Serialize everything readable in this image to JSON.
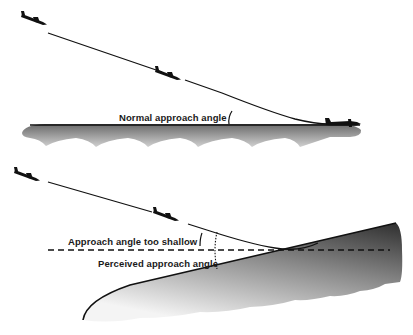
{
  "diagram": {
    "type": "approach-angle-illusion",
    "panels": [
      {
        "name": "normal-approach",
        "label": "Normal approach angle",
        "runway": "flat",
        "aircraft_positions": 3
      },
      {
        "name": "upsloping-runway",
        "labels": {
          "too_shallow": "Approach angle too shallow",
          "perceived": "Perceived approach angle"
        },
        "runway": "upsloping",
        "aircraft_positions": 2
      }
    ],
    "colors": {
      "ink": "#111111",
      "ground_dark": "#5a5a5a",
      "ground_light": "#e8e8e8",
      "background": "#ffffff"
    }
  }
}
